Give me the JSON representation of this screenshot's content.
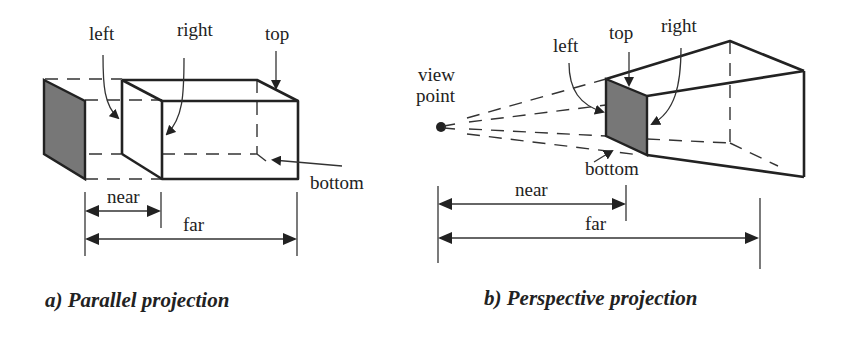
{
  "diagrams": {
    "parallel": {
      "caption": "a) Parallel projection",
      "labels": {
        "left": "left",
        "right": "right",
        "top": "top",
        "bottom": "bottom",
        "near": "near",
        "far": "far"
      }
    },
    "perspective": {
      "caption": "b) Perspective projection",
      "labels": {
        "view_point_line1": "view",
        "view_point_line2": "point",
        "left": "left",
        "top": "top",
        "right": "right",
        "bottom": "bottom",
        "near": "near",
        "far": "far"
      }
    }
  },
  "colors": {
    "line": "#222222",
    "shaded_plane": "#777777",
    "background": "#ffffff"
  }
}
